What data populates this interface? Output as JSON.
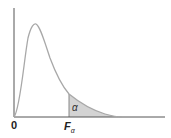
{
  "diagram": {
    "curve": "F-distribution density (right-skewed)",
    "colors": {
      "curve": "#a8a8a8",
      "axis": "#555555",
      "shade": "#d3d3d3",
      "critical_line": "#888888"
    },
    "labels": {
      "origin": "0",
      "critical_value_main": "F",
      "critical_value_sub": "α",
      "tail_area": "α"
    }
  }
}
